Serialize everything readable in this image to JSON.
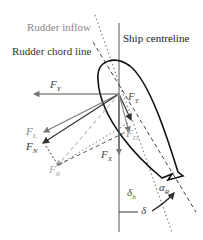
{
  "labels": {
    "rudder_inflow": "Rudder inflow",
    "rudder_chord_line": "Rudder chord line",
    "ship_centreline": "Ship centreline"
  },
  "forces": {
    "FY": {
      "main": "F",
      "sub": "Y"
    },
    "FT": {
      "main": "F",
      "sub": "T"
    },
    "FL": {
      "main": "F",
      "sub": "L"
    },
    "FN": {
      "main": "F",
      "sub": "N"
    },
    "FD": {
      "main": "F",
      "sub": "D"
    },
    "FR": {
      "main": "F",
      "sub": "R"
    },
    "FX": {
      "main": "F",
      "sub": "X"
    }
  },
  "angles": {
    "delta_h": {
      "main": "δ",
      "sub": "h"
    },
    "delta": {
      "main": "δ"
    },
    "alpha_R": {
      "main": "α",
      "sub": "R"
    }
  },
  "colors": {
    "primary": "#333333",
    "secondary": "#777777",
    "light": "#aaaaaa",
    "label_grey": "#888888"
  }
}
